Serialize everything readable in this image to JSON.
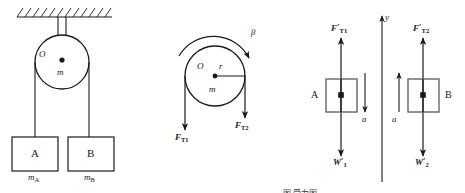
{
  "figure": {
    "title_caption": "图 受力图",
    "stroke_color": "#1a1a1a",
    "fill_color": "#ffffff",
    "background": "#ffffff"
  },
  "panel_left": {
    "name": "pulley-system-setup",
    "ceiling_label": "hatched-ceiling",
    "pulley": {
      "center_label": "O",
      "mass_label": "m"
    },
    "block_a": {
      "label": "A",
      "mass_label": "m",
      "mass_subscript": "A"
    },
    "block_b": {
      "label": "B",
      "mass_label": "m",
      "mass_subscript": "B"
    }
  },
  "panel_mid": {
    "name": "pulley-free-body-diagram",
    "center_label": "O",
    "radius_label": "r",
    "mass_label": "m",
    "angular_accel_label": "β",
    "tension_left": {
      "symbol": "F",
      "subscript": "T1"
    },
    "tension_right": {
      "symbol": "F",
      "subscript": "T2"
    }
  },
  "panel_right": {
    "name": "blocks-free-body-diagrams",
    "axis_label": "y",
    "block_a": {
      "label": "A",
      "tension": {
        "symbol": "F",
        "prime": "′",
        "subscript": "T1"
      },
      "weight": {
        "symbol": "W",
        "prime": "′",
        "subscript": "1"
      },
      "accel_label": "a",
      "accel_direction": "down"
    },
    "block_b": {
      "label": "B",
      "tension": {
        "symbol": "F",
        "prime": "′",
        "subscript": "T2"
      },
      "weight": {
        "symbol": "W",
        "prime": "′",
        "subscript": "2"
      },
      "accel_label": "a",
      "accel_direction": "up"
    }
  }
}
